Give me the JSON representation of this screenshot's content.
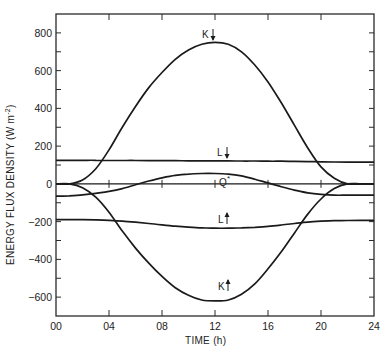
{
  "chart_data": {
    "type": "line",
    "title": "",
    "xlabel": "TIME  (h)",
    "ylabel": "ENERGY FLUX DENSITY  (W m⁻²)",
    "xlim": [
      0,
      24
    ],
    "ylim": [
      -700,
      900
    ],
    "grid": false,
    "legend": "inline labels",
    "x_ticks": [
      "00",
      "04",
      "08",
      "12",
      "16",
      "20",
      "24"
    ],
    "y_ticks": [
      800,
      600,
      400,
      200,
      0,
      -200,
      -400,
      -600
    ],
    "x": [
      0,
      1,
      2,
      3,
      4,
      5,
      6,
      7,
      8,
      9,
      10,
      11,
      12,
      13,
      14,
      15,
      16,
      17,
      18,
      19,
      20,
      21,
      22,
      23,
      24
    ],
    "series": [
      {
        "name": "K↓",
        "label": "K",
        "arrow": "down",
        "values": [
          0,
          0,
          20,
          80,
          180,
          300,
          410,
          510,
          590,
          660,
          710,
          740,
          750,
          740,
          700,
          630,
          540,
          430,
          310,
          190,
          90,
          30,
          0,
          0,
          0
        ]
      },
      {
        "name": "L↓",
        "label": "L",
        "arrow": "down",
        "values": [
          125,
          125,
          125,
          125,
          124,
          124,
          124,
          123,
          123,
          123,
          122,
          122,
          122,
          122,
          121,
          121,
          120,
          120,
          119,
          118,
          117,
          116,
          115,
          115,
          115
        ]
      },
      {
        "name": "Q*",
        "label": "Q*",
        "arrow": "",
        "values": [
          -65,
          -63,
          -58,
          -50,
          -40,
          -25,
          -5,
          15,
          32,
          45,
          52,
          55,
          55,
          52,
          42,
          25,
          5,
          -15,
          -33,
          -48,
          -56,
          -60,
          -60,
          -60,
          -60
        ]
      },
      {
        "name": "L↑",
        "label": "L",
        "arrow": "up",
        "values": [
          -190,
          -190,
          -190,
          -191,
          -193,
          -197,
          -203,
          -210,
          -217,
          -224,
          -229,
          -233,
          -235,
          -235,
          -233,
          -230,
          -225,
          -218,
          -210,
          -203,
          -198,
          -195,
          -194,
          -193,
          -193
        ]
      },
      {
        "name": "K↑",
        "label": "K",
        "arrow": "up",
        "values": [
          0,
          0,
          -20,
          -70,
          -150,
          -250,
          -340,
          -420,
          -490,
          -550,
          -590,
          -615,
          -620,
          -615,
          -585,
          -530,
          -450,
          -360,
          -260,
          -160,
          -80,
          -25,
          0,
          0,
          0
        ]
      }
    ],
    "annotations": [
      {
        "text": "K↓",
        "x": 12.9,
        "y": 800
      },
      {
        "text": "L↓",
        "x": 12.9,
        "y": 165
      },
      {
        "text": "Q*",
        "x": 13.0,
        "y": 0
      },
      {
        "text": "L↑",
        "x": 12.9,
        "y": -190
      },
      {
        "text": "K↑",
        "x": 12.9,
        "y": -535
      }
    ]
  },
  "axes": {
    "x_title": "TIME  (h)",
    "y_title": "ENERGY FLUX DENSITY  (W m",
    "y_title_sup": "-2",
    "y_title_end": ")"
  },
  "labels": {
    "k_down": "K",
    "l_down": "L",
    "q_star": "Q",
    "q_star_sup": "*",
    "l_up": "L",
    "k_up": "K"
  },
  "colors": {
    "line": "#1a1a1a",
    "axis": "#2a2a2a",
    "background": "#ffffff"
  }
}
